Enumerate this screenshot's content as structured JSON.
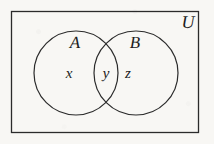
{
  "figure": {
    "type": "venn-diagram",
    "width": 214,
    "height": 144,
    "background_color": "#f8f7f4",
    "stroke_color": "#2b2b2b",
    "text_color": "#1d1d1d",
    "universe": {
      "label": "U",
      "shape": "rectangle",
      "x": 11,
      "y": 11,
      "width": 188,
      "height": 122,
      "label_x": 188,
      "label_y": 22
    },
    "sets": [
      {
        "label": "A",
        "shape": "circle",
        "cx": 76,
        "cy": 73,
        "r": 42,
        "label_x": 75,
        "label_y": 42
      },
      {
        "label": "B",
        "shape": "circle",
        "cx": 136,
        "cy": 73,
        "r": 42,
        "label_x": 135,
        "label_y": 42
      }
    ],
    "regions": [
      {
        "label": "x",
        "meaning": "A only",
        "x": 69,
        "y": 74
      },
      {
        "label": "y",
        "meaning": "A intersect B",
        "x": 106,
        "y": 74
      },
      {
        "label": "z",
        "meaning": "B only",
        "x": 128,
        "y": 74
      }
    ]
  }
}
